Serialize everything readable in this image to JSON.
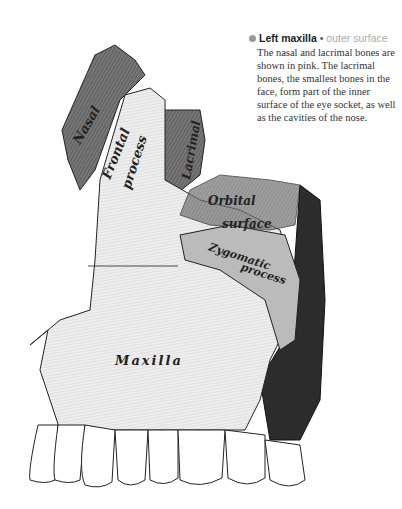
{
  "caption": {
    "title": "Left maxilla",
    "separator": "•",
    "subtitle": "outer surface",
    "body": "The nasal and lacrimal bones are shown in pink. The lacrimal bones, the smallest bones in the face, form part of the inner surface of the eye socket, as well as the cavities of the nose.",
    "dot_color": "#999999"
  },
  "labels": {
    "nasal": "Nasal",
    "frontal": "Frontal",
    "process1": "process",
    "lacrimal": "Lacrimal",
    "orbital": "Orbital",
    "surface": "surface",
    "zygomatic": "Zygomatic",
    "process2": "process",
    "maxilla": "Maxilla"
  }
}
